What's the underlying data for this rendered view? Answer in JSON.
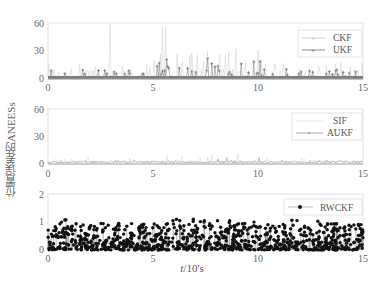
{
  "chart_data": [
    {
      "type": "line",
      "title": "",
      "ylabel": "位置误差的ANEESs",
      "xlabel": "t/10's",
      "xlim": [
        0,
        15
      ],
      "ylim": [
        0,
        60
      ],
      "xticks": [
        0,
        5,
        10,
        15
      ],
      "yticks": [
        0,
        30,
        60
      ],
      "legend_position": "upper right",
      "series": [
        {
          "name": "CKF",
          "color": "#c8c8c8",
          "marker": "+",
          "description": "noisy around 0-5 with spikes to ~35 between t=5 and t=10, occasional spikes up to 60"
        },
        {
          "name": "UKF",
          "color": "#666666",
          "marker": "+",
          "description": "baseline near 1-3 with spikes ~5-25, densest between t=5 and t=10"
        }
      ],
      "approx_peaks": {
        "CKF": 60,
        "UKF": 25
      }
    },
    {
      "type": "line",
      "ylim": [
        0,
        60
      ],
      "xlim": [
        0,
        15
      ],
      "xticks": [
        0,
        5,
        10,
        15
      ],
      "yticks": [
        0,
        30,
        60
      ],
      "legend_position": "upper right",
      "series": [
        {
          "name": "SIF",
          "color": "#cccccc",
          "marker": "none",
          "description": "mostly 0-5, spikes to ~12 between t=5 and t=10"
        },
        {
          "name": "AUKF",
          "color": "#888888",
          "marker": "·",
          "description": "near 1-3 throughout"
        }
      ]
    },
    {
      "type": "scatter",
      "ylim": [
        0,
        2
      ],
      "xlim": [
        0,
        15
      ],
      "xticks": [
        0,
        5,
        10,
        15
      ],
      "yticks": [
        0,
        1,
        2
      ],
      "legend_position": "upper right",
      "series": [
        {
          "name": "RWCKF",
          "color": "#111111",
          "marker": "●",
          "description": "dense points uniformly between 0 and ~1.1 over t=0..15, mean ~0.3"
        }
      ]
    }
  ],
  "labels": {
    "ylabel": "位置误差的ANEESs",
    "xlabel_var": "t",
    "xlabel_unit": "/10's"
  },
  "panels": [
    {
      "yticks": [
        "60",
        "30",
        "0"
      ],
      "xticks": [
        "0",
        "5",
        "10",
        "15"
      ],
      "legend": [
        "CKF",
        "UKF"
      ]
    },
    {
      "yticks": [
        "60",
        "30",
        "0"
      ],
      "xticks": [
        "0",
        "5",
        "10",
        "15"
      ],
      "legend": [
        "SIF",
        "AUKF"
      ]
    },
    {
      "yticks": [
        "2",
        "1",
        "0"
      ],
      "xticks": [
        "0",
        "5",
        "10",
        "15"
      ],
      "legend": [
        "RWCKF"
      ]
    }
  ]
}
